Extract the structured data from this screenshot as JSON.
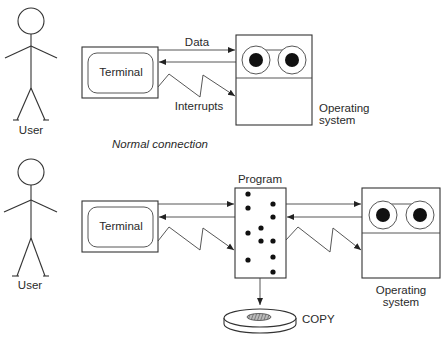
{
  "diagram": {
    "top": {
      "caption": "Normal connection",
      "user_label": "User",
      "terminal_label": "Terminal",
      "data_label": "Data",
      "interrupts_label": "Interrupts",
      "os_label_line1": "Operating",
      "os_label_line2": "system"
    },
    "bottom": {
      "user_label": "User",
      "terminal_label": "Terminal",
      "program_label": "Program",
      "copy_label": "COPY",
      "os_label_line1": "Operating",
      "os_label_line2": "system"
    }
  }
}
